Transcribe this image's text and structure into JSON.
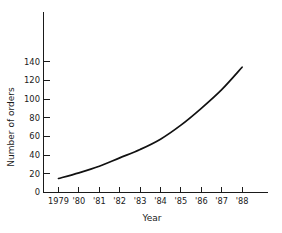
{
  "chart_data": {
    "type": "line",
    "title": "",
    "xlabel": "Year",
    "ylabel": "Number of orders",
    "x": [
      1979,
      1980,
      1981,
      1982,
      1983,
      1984,
      1985,
      1986,
      1987,
      1988
    ],
    "xtick_labels": [
      "1979",
      "'80",
      "'81",
      "'82",
      "'83",
      "'84",
      "'85",
      "'86",
      "'87",
      "'88"
    ],
    "ytick_labels": [
      "0",
      "20",
      "40",
      "60",
      "80",
      "100",
      "120",
      "140"
    ],
    "yticks": [
      0,
      20,
      40,
      60,
      80,
      100,
      120,
      140
    ],
    "values": [
      15,
      21,
      28,
      37,
      46,
      57,
      72,
      90,
      110,
      134
    ],
    "series": [
      {
        "name": "Number of orders",
        "values": [
          15,
          21,
          28,
          37,
          46,
          57,
          72,
          90,
          110,
          134
        ]
      }
    ],
    "xlim": [
      1979,
      1988
    ],
    "ylim": [
      0,
      150
    ],
    "grid": false,
    "legend": false,
    "line_color": "#111111"
  },
  "axes": {
    "y_title": "Number of orders",
    "x_title": "Year"
  }
}
